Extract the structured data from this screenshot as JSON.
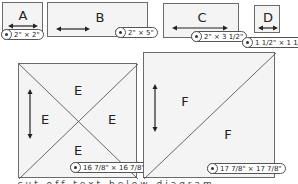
{
  "pieces": [
    {
      "id": "A",
      "label": "A",
      "size": "2\" × 2\"",
      "grain": "horizontal"
    },
    {
      "id": "B",
      "label": "B",
      "size": "2\" × 5\"",
      "grain": "horizontal"
    },
    {
      "id": "C",
      "label": "C",
      "size": "2\" × 3 1/2\"",
      "grain": "horizontal"
    },
    {
      "id": "D",
      "label": "D",
      "size": "1 1/2\" × 1 1/2\"",
      "grain": "horizontal"
    },
    {
      "id": "E",
      "label": "E",
      "size": "16 7/8\" × 16 7/8\"",
      "grain": "vertical",
      "cut": "quarter-square triangles",
      "sub_labels": [
        "E",
        "E",
        "E",
        "E"
      ]
    },
    {
      "id": "F",
      "label": "F",
      "size": "17 7/8\" × 17 7/8\"",
      "grain": "vertical",
      "cut": "half-square triangles",
      "sub_labels": [
        "F",
        "F"
      ]
    }
  ],
  "footer_text_partial": "...cut off text below diagram..."
}
